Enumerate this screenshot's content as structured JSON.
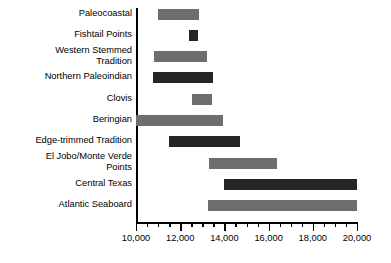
{
  "chart_data": {
    "type": "bar",
    "orientation": "horizontal",
    "subtype": "range-bar",
    "title": "",
    "xlabel": "",
    "ylabel": "",
    "xlim": [
      10000,
      20000
    ],
    "grid": false,
    "legend": null,
    "axis": {
      "major_ticks": [
        10000,
        12000,
        14000,
        16000,
        18000,
        20000
      ],
      "major_tick_labels": [
        "10,000",
        "12,000",
        "14,000",
        "16,000",
        "18,000",
        "20,000"
      ],
      "minor_tick_interval": 500,
      "direction": "left-to-right-increasing"
    },
    "categories": [
      "Paleocoastal",
      "Fishtail Points",
      "Western Stemmed\nTradition",
      "Northern Paleoindian",
      "Clovis",
      "Beringian",
      "Edge-trimmed Tradition",
      "El Jobo/Monte Verde\nPoints",
      "Central Texas",
      "Atlantic Seaboard"
    ],
    "bars": [
      {
        "label": "Paleocoastal",
        "start": 11000,
        "end": 12850,
        "shade": "medium"
      },
      {
        "label": "Fishtail Points",
        "start": 12400,
        "end": 12800,
        "shade": "dark"
      },
      {
        "label": "Western Stemmed Tradition",
        "start": 10800,
        "end": 13200,
        "shade": "medium"
      },
      {
        "label": "Northern Paleoindian",
        "start": 10750,
        "end": 13500,
        "shade": "dark"
      },
      {
        "label": "Clovis",
        "start": 12550,
        "end": 13450,
        "shade": "medium"
      },
      {
        "label": "Beringian",
        "start": 10000,
        "end": 13950,
        "shade": "medium"
      },
      {
        "label": "Edge-trimmed Tradition",
        "start": 11500,
        "end": 14700,
        "shade": "dark"
      },
      {
        "label": "El Jobo/Monte Verde Points",
        "start": 13300,
        "end": 16400,
        "shade": "medium"
      },
      {
        "label": "Central Texas",
        "start": 14000,
        "end": 20000,
        "shade": "dark"
      },
      {
        "label": "Atlantic Seaboard",
        "start": 13250,
        "end": 20000,
        "shade": "medium"
      }
    ]
  },
  "colors": {
    "medium": "#6e6e6e",
    "dark": "#262626",
    "axis": "#000000",
    "background": "#ffffff",
    "text": "#000000"
  }
}
